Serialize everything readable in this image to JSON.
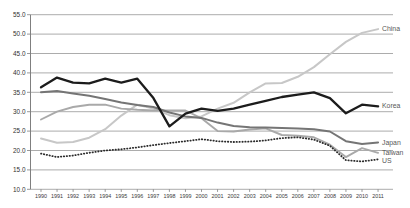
{
  "figure": {
    "width": 410,
    "height": 208,
    "background": "#ffffff",
    "title": ""
  },
  "chart_data": {
    "type": "line",
    "title": "",
    "xlabel": "",
    "ylabel": "",
    "grid": true,
    "legend_position": "right-end-of-line-labels",
    "x": [
      "1990",
      "1991",
      "1992",
      "1993",
      "1994",
      "1995",
      "1996",
      "1997",
      "1998",
      "1999",
      "2000",
      "2001",
      "2002",
      "2003",
      "2004",
      "2005",
      "2006",
      "2007",
      "2008",
      "2009",
      "2010",
      "2011"
    ],
    "y_axis": {
      "min": 10,
      "max": 55,
      "step": 5,
      "tick_labels": [
        "55.0",
        "50.0",
        "45.0",
        "40.0",
        "35.0",
        "30.0",
        "25.0",
        "20.0",
        "15.0",
        "10.0"
      ]
    },
    "series": [
      {
        "name": "China",
        "color": "#c7c7c7",
        "style": "solid",
        "values": [
          23.1,
          22.0,
          22.2,
          23.3,
          25.5,
          29.0,
          31.8,
          30.8,
          29.1,
          28.3,
          28.8,
          30.8,
          32.3,
          35.0,
          37.3,
          37.4,
          39.0,
          41.5,
          44.8,
          48.0,
          50.3,
          51.3
        ]
      },
      {
        "name": "Taiwan",
        "color": "#a9a9a9",
        "style": "solid",
        "values": [
          28.0,
          30.0,
          31.2,
          31.8,
          31.8,
          30.8,
          30.5,
          30.3,
          30.3,
          30.3,
          28.3,
          25.0,
          24.9,
          25.4,
          25.7,
          24.0,
          23.8,
          23.4,
          21.5,
          18.3,
          20.6,
          19.4
        ]
      },
      {
        "name": "Japan",
        "color": "#757575",
        "style": "solid",
        "values": [
          35.0,
          35.3,
          34.7,
          34.1,
          33.3,
          32.4,
          31.7,
          31.2,
          29.8,
          28.8,
          28.4,
          27.2,
          26.3,
          26.0,
          25.9,
          25.8,
          25.7,
          25.5,
          24.9,
          22.4,
          21.7,
          22.1
        ]
      },
      {
        "name": "Korea",
        "color": "#1c1c1c",
        "style": "solid",
        "values": [
          36.3,
          38.8,
          37.5,
          37.3,
          38.5,
          37.5,
          38.5,
          33.5,
          26.2,
          29.5,
          30.8,
          30.2,
          30.8,
          31.8,
          32.8,
          33.8,
          34.4,
          35.0,
          33.5,
          29.6,
          31.8,
          31.4
        ]
      },
      {
        "name": "US",
        "color": "#2b2b2b",
        "style": "dotted",
        "values": [
          19.2,
          18.3,
          18.7,
          19.4,
          20.0,
          20.3,
          20.8,
          21.4,
          21.9,
          22.4,
          22.9,
          22.4,
          22.2,
          22.3,
          22.6,
          23.2,
          23.4,
          22.8,
          21.2,
          17.5,
          17.2,
          17.7
        ]
      }
    ]
  }
}
